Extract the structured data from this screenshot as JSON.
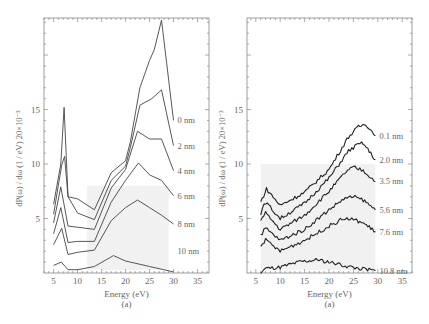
{
  "chart_data": [
    {
      "type": "line",
      "panel": "left",
      "title": "",
      "caption": "(a)",
      "xlabel": "Energy (eV)",
      "ylabel": "dP(ω) / dω (1 / eV)  20×10⁻³",
      "xlim": [
        3,
        37.4
      ],
      "ylim": [
        0,
        23.4
      ],
      "xticks": [
        5,
        10,
        15,
        20,
        25,
        30,
        35
      ],
      "yticks": [
        5,
        10,
        15
      ],
      "grid": false,
      "legend": "inline-right",
      "series": [
        {
          "name": "0 nm",
          "x": [
            5,
            6.5,
            7.2,
            8,
            10,
            13.5,
            17,
            20,
            21,
            23,
            25,
            26,
            27.5,
            30
          ],
          "y": [
            6.3,
            10,
            15.2,
            7,
            6.8,
            5.8,
            9.2,
            10.3,
            12,
            17,
            19.5,
            20.5,
            23.2,
            14
          ]
        },
        {
          "name": "2 nm",
          "x": [
            5,
            6.7,
            7.3,
            8,
            10,
            13.5,
            17,
            20,
            21,
            23,
            25.5,
            27.5,
            30
          ],
          "y": [
            5.4,
            9.9,
            10.7,
            7,
            5.5,
            4.9,
            8.5,
            9.8,
            11.5,
            15.4,
            16,
            16.8,
            11.7
          ]
        },
        {
          "name": "4 nm",
          "x": [
            5,
            6.5,
            8,
            10,
            13.5,
            17,
            20,
            22.5,
            25,
            27.5,
            30
          ],
          "y": [
            4.6,
            7.9,
            4.3,
            4.2,
            4.0,
            7.8,
            9.5,
            13,
            12.3,
            12.3,
            9.4
          ]
        },
        {
          "name": "6 nm",
          "x": [
            5,
            6.5,
            8,
            10,
            13.5,
            17,
            20,
            22.7,
            25,
            27.5,
            30
          ],
          "y": [
            3.6,
            6.0,
            2.8,
            2.9,
            2.9,
            6.5,
            8.5,
            10.1,
            9.0,
            8.5,
            7.1
          ]
        },
        {
          "name": "8 nm",
          "x": [
            5,
            6.7,
            8,
            10,
            13.5,
            17,
            20,
            22.5,
            25,
            27.5,
            30
          ],
          "y": [
            2.6,
            4.1,
            1.7,
            1.9,
            2.1,
            4.8,
            6.0,
            6.7,
            6.0,
            5.3,
            4.5
          ]
        },
        {
          "name": "10 nm",
          "x": [
            5,
            6.6,
            8,
            10,
            13.5,
            17.5,
            20,
            25,
            30
          ],
          "y": [
            0.7,
            1.0,
            0.3,
            0.3,
            0.6,
            1.6,
            1.1,
            0.6,
            0.1
          ]
        }
      ]
    },
    {
      "type": "line",
      "panel": "right",
      "title": "",
      "caption": "(a)",
      "xlabel": "Energy (eV)",
      "ylabel": "dP(ω) / dω (1 / eV)  20×10⁻³",
      "xlim": [
        3.2,
        37
      ],
      "ylim": [
        0,
        23.4
      ],
      "xticks": [
        5,
        10,
        15,
        20,
        25,
        30,
        35
      ],
      "yticks": [
        5,
        10,
        15
      ],
      "grid": false,
      "legend": "inline-right",
      "series": [
        {
          "name": "0.1 nm",
          "x": [
            6,
            7.2,
            10,
            15,
            20,
            24,
            26,
            27.5,
            29.5
          ],
          "y": [
            6.5,
            7.7,
            6.2,
            7.4,
            9.5,
            12.5,
            13.4,
            13.7,
            12.6
          ]
        },
        {
          "name": "2.0 nm",
          "x": [
            6,
            7,
            10,
            15,
            20,
            24,
            26,
            27,
            29.5
          ],
          "y": [
            5.5,
            6.5,
            5.0,
            6.4,
            8.7,
            11.2,
            11.8,
            11.9,
            10.4
          ]
        },
        {
          "name": "3.5 nm",
          "x": [
            6,
            7,
            10,
            15,
            20,
            23.5,
            25,
            27,
            29.5
          ],
          "y": [
            4.8,
            5.5,
            4.0,
            5.3,
            7.5,
            9.3,
            9.7,
            9.4,
            8.4
          ]
        },
        {
          "name": "5.6 nm",
          "x": [
            6,
            7,
            10,
            15,
            20,
            23,
            25,
            27,
            29.5
          ],
          "y": [
            3.5,
            4.1,
            3.0,
            4.0,
            5.8,
            6.8,
            7.0,
            6.7,
            5.8
          ]
        },
        {
          "name": "7.6 nm",
          "x": [
            6,
            7,
            10,
            15,
            20,
            23,
            25,
            27,
            29.5
          ],
          "y": [
            2.6,
            3.0,
            2.0,
            3.0,
            4.3,
            5.0,
            4.9,
            4.6,
            3.8
          ]
        },
        {
          "name": "10.8 nm",
          "x": [
            6,
            7,
            10,
            14,
            18,
            22,
            25,
            29.5
          ],
          "y": [
            0.0,
            0.4,
            0.5,
            1.0,
            1.2,
            0.8,
            0.5,
            0.2
          ]
        }
      ]
    }
  ]
}
